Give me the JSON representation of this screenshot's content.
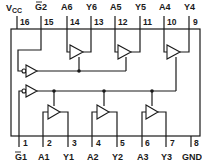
{
  "top_pins": [
    {
      "num": "16",
      "label": "VCC",
      "x": 17
    },
    {
      "num": "15",
      "label": "G2",
      "overbar": true,
      "x": 41
    },
    {
      "num": "14",
      "label": "A6",
      "x": 67
    },
    {
      "num": "13",
      "label": "Y6",
      "x": 91
    },
    {
      "num": "12",
      "label": "A5",
      "x": 115
    },
    {
      "num": "11",
      "label": "Y5",
      "x": 140
    },
    {
      "num": "10",
      "label": "A4",
      "x": 164
    },
    {
      "num": "9",
      "label": "Y4",
      "x": 189
    }
  ],
  "bottom_pins": [
    {
      "num": "1",
      "label": "G1",
      "overbar": true,
      "x": 19
    },
    {
      "num": "2",
      "label": "A1",
      "x": 43
    },
    {
      "num": "3",
      "label": "Y1",
      "x": 68
    },
    {
      "num": "4",
      "label": "A2",
      "x": 92
    },
    {
      "num": "5",
      "label": "Y2",
      "x": 117
    },
    {
      "num": "6",
      "label": "A3",
      "x": 142
    },
    {
      "num": "7",
      "label": "Y3",
      "x": 166
    },
    {
      "num": "8",
      "label": "GND",
      "x": 191
    }
  ],
  "vcc": {
    "main": "V",
    "sub": "CC"
  },
  "colors": {
    "line": "#1a1a1a",
    "background": "#ffffff"
  }
}
